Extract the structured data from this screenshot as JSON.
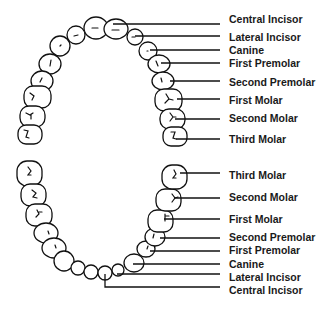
{
  "diagram": {
    "upper_arch": {
      "name": "Upper teeth",
      "labels": [
        {
          "text": "Central Incisor",
          "y": 20
        },
        {
          "text": "Lateral Incisor",
          "y": 38
        },
        {
          "text": "Canine",
          "y": 51
        },
        {
          "text": "First Premolar",
          "y": 64
        },
        {
          "text": "Second Premolar",
          "y": 82
        },
        {
          "text": "First Molar",
          "y": 100
        },
        {
          "text": "Second Molar",
          "y": 118
        },
        {
          "text": "Third Molar",
          "y": 140
        }
      ]
    },
    "lower_arch": {
      "name": "Lower teeth",
      "labels": [
        {
          "text": "Third Molar",
          "y": 175
        },
        {
          "text": "Second Molar",
          "y": 197
        },
        {
          "text": "First Molar",
          "y": 219
        },
        {
          "text": "Second Premolar",
          "y": 237
        },
        {
          "text": "First Premolar",
          "y": 250
        },
        {
          "text": "Canine",
          "y": 264
        },
        {
          "text": "Lateral Incisor",
          "y": 277
        },
        {
          "text": "Central Incisor",
          "y": 291
        }
      ]
    },
    "colors": {
      "line": "#111111",
      "text": "#1a1a1a",
      "background": "#ffffff"
    }
  }
}
